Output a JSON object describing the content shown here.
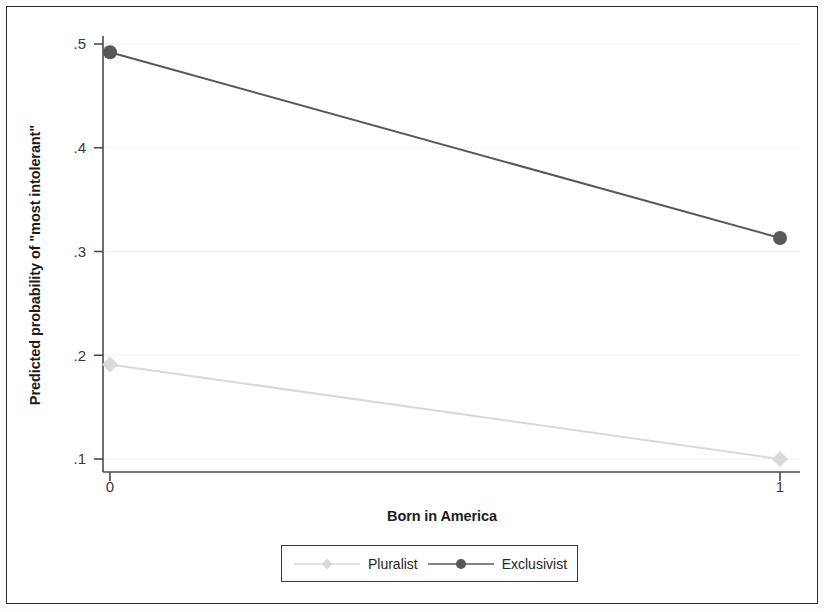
{
  "chart_data": {
    "type": "line",
    "title": "",
    "subtitle": "",
    "xlabel": "Born in America",
    "ylabel": "Predicted probability of \"most intolerant\"",
    "x": [
      0,
      1
    ],
    "xtick_labels": [
      "0",
      "1"
    ],
    "ytick_labels": [
      ".1",
      ".2",
      ".3",
      ".4",
      ".5"
    ],
    "ytick_values": [
      0.1,
      0.2,
      0.3,
      0.4,
      0.5
    ],
    "ylim": [
      0.085,
      0.515
    ],
    "xlim": [
      -0.06,
      1.06
    ],
    "grid": "horizontal-faint",
    "legend_position": "bottom-center",
    "series": [
      {
        "name": "Pluralist",
        "values": [
          0.191,
          0.1
        ],
        "color": "#d9d9d9",
        "marker": "diamond"
      },
      {
        "name": "Exclusivist",
        "values": [
          0.492,
          0.313
        ],
        "color": "#585858",
        "marker": "circle"
      }
    ]
  },
  "axes": {
    "y_title": "Predicted probability of \"most intolerant\"",
    "x_title": "Born in America",
    "y_ticks": [
      {
        "label": ".5",
        "value": 0.5
      },
      {
        "label": ".4",
        "value": 0.4
      },
      {
        "label": ".3",
        "value": 0.3
      },
      {
        "label": ".2",
        "value": 0.2
      },
      {
        "label": ".1",
        "value": 0.1
      }
    ],
    "x_ticks": [
      {
        "label": "0",
        "value": 0
      },
      {
        "label": "1",
        "value": 1
      }
    ]
  },
  "legend": {
    "entries": [
      {
        "label": "Pluralist",
        "color": "#d9d9d9",
        "marker": "diamond"
      },
      {
        "label": "Exclusivist",
        "color": "#585858",
        "marker": "circle"
      }
    ]
  },
  "colors": {
    "frame": "#2b2b2b",
    "axis": "#4a4a4a",
    "gridline": "#f0f0f0",
    "text": "#1c1c1c",
    "tick_text": "#3a3a3a",
    "pluralist": "#d9d9d9",
    "exclusivist": "#585858",
    "background": "#ffffff"
  }
}
